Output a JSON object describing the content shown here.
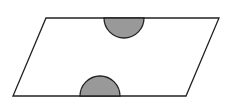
{
  "diagram": {
    "type": "geometry",
    "colors": {
      "outline": "#222222",
      "fill_shape": "#ffffff",
      "semicircle_fill": "#999999",
      "background": "#ffffff"
    },
    "parallelogram": {
      "points": [
        [
          46,
          18
        ],
        [
          219,
          18
        ],
        [
          186,
          96
        ],
        [
          13,
          96
        ]
      ]
    },
    "semicircles": [
      {
        "name": "top",
        "cx": 124,
        "cy": 18,
        "r": 20,
        "direction": "down"
      },
      {
        "name": "bottom",
        "cx": 100,
        "cy": 96,
        "r": 20,
        "direction": "up"
      }
    ]
  }
}
